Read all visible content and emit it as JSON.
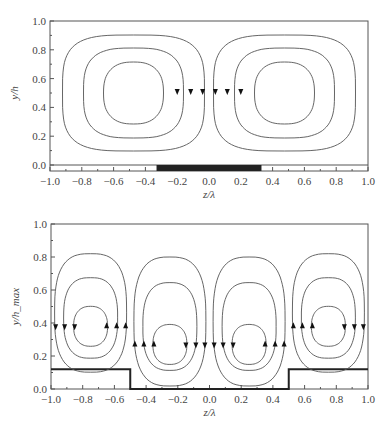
{
  "chart_data": [
    {
      "type": "line",
      "title": "",
      "xlabel": "z/λ",
      "ylabel": "y/h",
      "xlim": [
        -1.0,
        1.0
      ],
      "ylim": [
        0.0,
        1.0
      ],
      "xticks": [
        "-1.0",
        "-0.8",
        "-0.6",
        "-0.4",
        "-0.2",
        "0.0",
        "0.2",
        "0.4",
        "0.6",
        "0.8",
        "1.0"
      ],
      "yticks": [
        "0.0",
        "0.2",
        "0.4",
        "0.6",
        "0.8",
        "1.0"
      ],
      "grid": false,
      "description": "Two counter-rotating streamline cells (3 closed contours each) centered at z/λ≈±0.5, y/h≈0.5; dark bar on wall from z/λ=-0.33 to 0.33",
      "cells": [
        {
          "center_z": -0.5,
          "center_y": 0.5,
          "contours": 3
        },
        {
          "center_z": 0.5,
          "center_y": 0.5,
          "contours": 3
        }
      ],
      "heated_segment": [
        -0.33,
        0.33
      ]
    },
    {
      "type": "line",
      "title": "",
      "xlabel": "z/λ",
      "ylabel": "y/h_max",
      "xlim": [
        -1.0,
        1.0
      ],
      "ylim": [
        0.0,
        1.0
      ],
      "xticks": [
        "-1.0",
        "-0.8",
        "-0.6",
        "-0.4",
        "-0.2",
        "0.0",
        "0.2",
        "0.4",
        "0.6",
        "0.8",
        "1.0"
      ],
      "yticks": [
        "0.0",
        "0.2",
        "0.4",
        "0.6",
        "0.8",
        "1.0"
      ],
      "grid": false,
      "description": "Four streamline cells (3 closed contours each) centered at z/λ≈-0.75,-0.25,0.25,0.75; step wall of height 0.12 for |z/λ|>0.5",
      "cells": [
        {
          "center_z": -0.75,
          "center_y": 0.38,
          "contours": 3
        },
        {
          "center_z": -0.25,
          "center_y": 0.27,
          "contours": 3
        },
        {
          "center_z": 0.25,
          "center_y": 0.27,
          "contours": 3
        },
        {
          "center_z": 0.75,
          "center_y": 0.38,
          "contours": 3
        }
      ],
      "step_wall": {
        "height": 0.12,
        "z_ranges": [
          [
            -1.0,
            -0.5
          ],
          [
            0.5,
            1.0
          ]
        ]
      }
    }
  ]
}
